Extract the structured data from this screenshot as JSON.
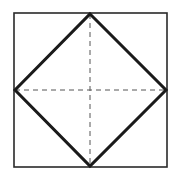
{
  "diagram": {
    "type": "geometric-figure",
    "colors": {
      "background": "#ffffff",
      "stroke": "#1a1a1a",
      "outer_square": "#2a2a2a",
      "dashed": "#555555"
    },
    "outer_square": {
      "x": 14,
      "y": 13,
      "width": 153,
      "height": 154,
      "stroke_width": 1.6
    },
    "diamond": {
      "points": [
        [
          90,
          14
        ],
        [
          166,
          90
        ],
        [
          90,
          166
        ],
        [
          15,
          90
        ]
      ],
      "stroke_width": 3
    },
    "dashed_lines": [
      {
        "name": "vertical-center-line",
        "x1": 90,
        "y1": 14,
        "x2": 90,
        "y2": 166,
        "dash": "5,4"
      },
      {
        "name": "horizontal-center-line",
        "x1": 15,
        "y1": 90,
        "x2": 166,
        "y2": 90,
        "dash": "5,4"
      }
    ]
  }
}
